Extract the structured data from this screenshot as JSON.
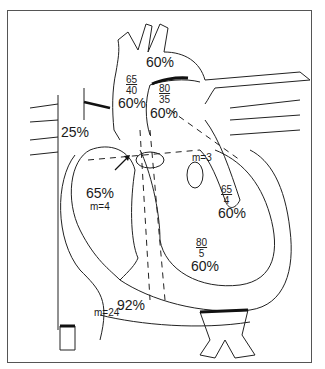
{
  "diagram": {
    "type": "heart-hemodynamics",
    "colors": {
      "line": "#222222",
      "fill": "#ffffff",
      "frame": "#555555",
      "accent_black": "#111111"
    },
    "labels": {
      "aortic_arch_sat": "60%",
      "ascending_aorta_pressure": {
        "systolic": "65",
        "diastolic": "40"
      },
      "ascending_aorta_sat": "60%",
      "pulmonary_artery_pressure": {
        "systolic": "80",
        "diastolic": "35"
      },
      "pulmonary_artery_sat": "60%",
      "svc_sat": "25%",
      "right_atrium_sat": "65%",
      "right_atrium_mean": "m=4",
      "left_atrium_mean": "m=3",
      "left_atrium_pressure": {
        "systolic": "65",
        "diastolic": "4"
      },
      "left_ventricle_sat": "60%",
      "right_ventricle_pressure": {
        "systolic": "80",
        "diastolic": "5"
      },
      "right_ventricle_sat": "60%",
      "ivc_sat": "92%",
      "ivc_mean": "m=24"
    }
  }
}
